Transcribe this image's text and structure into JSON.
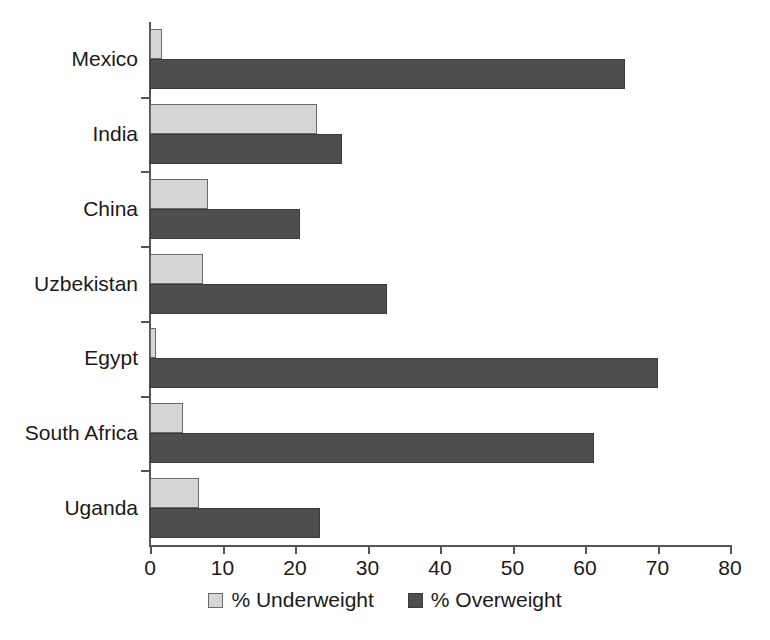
{
  "chart_data": {
    "type": "bar",
    "orientation": "horizontal",
    "title": "",
    "subtitle": "",
    "xlabel": "",
    "ylabel": "",
    "xlim": [
      0,
      80
    ],
    "xticks": [
      0,
      10,
      20,
      30,
      40,
      50,
      60,
      70,
      80
    ],
    "grid": false,
    "legend_position": "bottom-center",
    "categories": [
      "Mexico",
      "India",
      "China",
      "Uzbekistan",
      "Egypt",
      "South Africa",
      "Uganda"
    ],
    "series": [
      {
        "name": "% Underweight",
        "color": "#d6d6d6",
        "values": [
          1.6,
          23.0,
          8.0,
          7.3,
          0.8,
          4.6,
          6.8
        ]
      },
      {
        "name": "% Overweight",
        "color": "#4e4e4e",
        "values": [
          65.5,
          26.5,
          20.7,
          32.7,
          70.0,
          61.2,
          23.5
        ]
      }
    ]
  },
  "legend": {
    "items": [
      {
        "label": "% Underweight",
        "swatch": "light-gray-swatch-icon"
      },
      {
        "label": "% Overweight",
        "swatch": "dark-gray-swatch-icon"
      }
    ]
  },
  "axis": {
    "x_tick_labels": [
      "0",
      "10",
      "20",
      "30",
      "40",
      "50",
      "60",
      "70",
      "80"
    ],
    "y_tick_labels": [
      "Mexico",
      "India",
      "China",
      "Uzbekistan",
      "Egypt",
      "South Africa",
      "Uganda"
    ]
  }
}
